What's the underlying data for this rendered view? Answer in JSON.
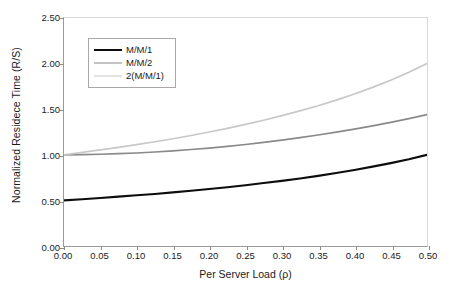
{
  "chart_data": {
    "type": "line",
    "title": "",
    "xlabel": "Per Server Load (ρ)",
    "ylabel": "Normalized Residece Time (R/S)",
    "xlim": [
      0.0,
      0.5
    ],
    "ylim": [
      0.0,
      2.5
    ],
    "grid": false,
    "legend_position": "upper-left-inside",
    "xticks": [
      "0.00",
      "0.05",
      "0.10",
      "0.15",
      "0.20",
      "0.25",
      "0.30",
      "0.35",
      "0.40",
      "0.45",
      "0.50"
    ],
    "xtick_values": [
      0.0,
      0.05,
      0.1,
      0.15,
      0.2,
      0.25,
      0.3,
      0.35,
      0.4,
      0.45,
      0.5
    ],
    "yticks": [
      "0.00",
      "0.50",
      "1.00",
      "1.50",
      "2.00",
      "2.50"
    ],
    "ytick_values": [
      0.0,
      0.5,
      1.0,
      1.5,
      2.0,
      2.5
    ],
    "x": [
      0.0,
      0.025,
      0.05,
      0.075,
      0.1,
      0.125,
      0.15,
      0.175,
      0.2,
      0.225,
      0.25,
      0.275,
      0.3,
      0.325,
      0.35,
      0.375,
      0.4,
      0.425,
      0.45,
      0.475,
      0.5
    ],
    "series": [
      {
        "name": "M/M/1",
        "color": "#0d0d0d",
        "width": 2.1,
        "values": [
          0.5,
          0.513,
          0.526,
          0.541,
          0.556,
          0.571,
          0.588,
          0.606,
          0.625,
          0.645,
          0.667,
          0.69,
          0.714,
          0.741,
          0.769,
          0.8,
          0.833,
          0.87,
          0.909,
          0.952,
          1.0
        ]
      },
      {
        "name": "M/M/2",
        "color": "#8a8a8a",
        "width": 1.7,
        "values": [
          1.0,
          1.002,
          1.006,
          1.012,
          1.02,
          1.031,
          1.043,
          1.058,
          1.074,
          1.093,
          1.113,
          1.136,
          1.161,
          1.188,
          1.217,
          1.248,
          1.282,
          1.318,
          1.356,
          1.397,
          1.44
        ]
      },
      {
        "name": "2(M/M/1)",
        "color": "#c8c8c8",
        "width": 1.7,
        "values": [
          1.0,
          1.026,
          1.053,
          1.081,
          1.111,
          1.143,
          1.176,
          1.212,
          1.25,
          1.29,
          1.333,
          1.379,
          1.429,
          1.481,
          1.538,
          1.6,
          1.667,
          1.739,
          1.818,
          1.905,
          2.0
        ]
      }
    ]
  },
  "legend": {
    "items": [
      {
        "label": "M/M/1"
      },
      {
        "label": "M/M/2"
      },
      {
        "label": "2(M/M/1)"
      }
    ]
  }
}
